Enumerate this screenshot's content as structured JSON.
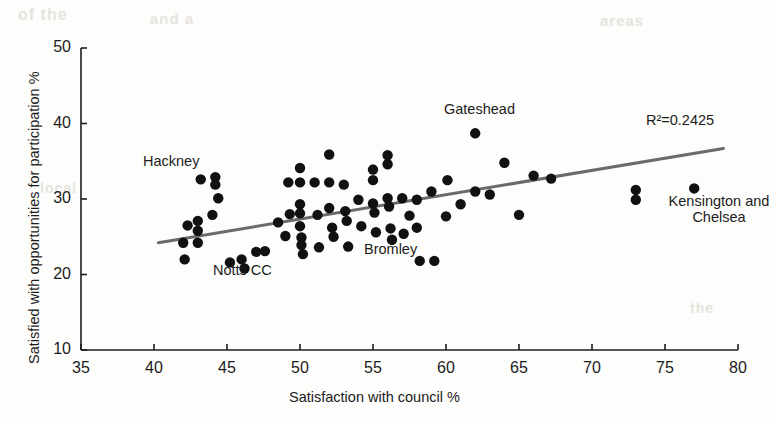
{
  "chart_data": {
    "type": "scatter",
    "title": "",
    "xlabel": "Satisfaction with council %",
    "ylabel": "Satisfied with opportunities for participation %",
    "xlim": [
      35,
      80
    ],
    "ylim": [
      10,
      50
    ],
    "xticks": [
      35,
      40,
      45,
      50,
      55,
      60,
      65,
      70,
      75,
      80
    ],
    "yticks": [
      10,
      20,
      30,
      40,
      50
    ],
    "grid": false,
    "legend": null,
    "r_squared_label": "R²=0.2425",
    "r_squared": 0.2425,
    "trendline": {
      "x_start": 40.3,
      "y_start": 24.2,
      "x_end": 79.0,
      "y_end": 36.7,
      "color": "#6a6a6a",
      "width": 3
    },
    "marker": {
      "color": "#111111",
      "radius": 5.2,
      "shape": "circle"
    },
    "annotations": [
      {
        "name": "Hackney",
        "text": "Hackney",
        "x": 44.2,
        "y": 32.6,
        "align": "right"
      },
      {
        "name": "Notts CC",
        "text": "Notts CC",
        "x": 46.2,
        "y": 18.2,
        "align": "center"
      },
      {
        "name": "Gateshead",
        "text": "Gateshead",
        "x": 62.0,
        "y": 41.0,
        "align": "center"
      },
      {
        "name": "Bromley",
        "text": "Bromley",
        "x": 57.3,
        "y": 21.8,
        "align": "right"
      },
      {
        "name": "Kensington and Chelsea",
        "text": "Kensington and Chelsea",
        "x": 77.2,
        "y": 29.6,
        "align": "center"
      }
    ],
    "points": [
      {
        "x": 42.0,
        "y": 24.2
      },
      {
        "x": 42.1,
        "y": 22.0
      },
      {
        "x": 42.3,
        "y": 26.5
      },
      {
        "x": 43.0,
        "y": 27.1
      },
      {
        "x": 43.0,
        "y": 25.8
      },
      {
        "x": 43.0,
        "y": 24.2
      },
      {
        "x": 43.2,
        "y": 32.6
      },
      {
        "x": 44.0,
        "y": 27.9
      },
      {
        "x": 44.2,
        "y": 32.9
      },
      {
        "x": 44.2,
        "y": 31.9
      },
      {
        "x": 44.4,
        "y": 30.1
      },
      {
        "x": 45.2,
        "y": 21.6
      },
      {
        "x": 46.0,
        "y": 22.0
      },
      {
        "x": 46.2,
        "y": 20.8
      },
      {
        "x": 47.0,
        "y": 23.0
      },
      {
        "x": 47.6,
        "y": 23.1
      },
      {
        "x": 48.5,
        "y": 26.9
      },
      {
        "x": 49.0,
        "y": 25.1
      },
      {
        "x": 49.2,
        "y": 32.2
      },
      {
        "x": 49.3,
        "y": 28.0
      },
      {
        "x": 50.0,
        "y": 34.1
      },
      {
        "x": 50.0,
        "y": 32.2
      },
      {
        "x": 50.0,
        "y": 29.3
      },
      {
        "x": 50.0,
        "y": 28.1
      },
      {
        "x": 50.0,
        "y": 26.4
      },
      {
        "x": 50.1,
        "y": 24.9
      },
      {
        "x": 50.1,
        "y": 23.9
      },
      {
        "x": 50.2,
        "y": 22.7
      },
      {
        "x": 51.0,
        "y": 32.2
      },
      {
        "x": 51.2,
        "y": 27.9
      },
      {
        "x": 51.3,
        "y": 23.6
      },
      {
        "x": 52.0,
        "y": 35.9
      },
      {
        "x": 52.0,
        "y": 32.2
      },
      {
        "x": 52.0,
        "y": 28.8
      },
      {
        "x": 52.2,
        "y": 26.2
      },
      {
        "x": 52.3,
        "y": 25.0
      },
      {
        "x": 53.0,
        "y": 31.9
      },
      {
        "x": 53.1,
        "y": 28.4
      },
      {
        "x": 53.2,
        "y": 27.1
      },
      {
        "x": 53.3,
        "y": 23.7
      },
      {
        "x": 54.0,
        "y": 29.9
      },
      {
        "x": 54.2,
        "y": 26.4
      },
      {
        "x": 55.0,
        "y": 33.9
      },
      {
        "x": 55.0,
        "y": 32.5
      },
      {
        "x": 55.0,
        "y": 29.4
      },
      {
        "x": 55.1,
        "y": 28.2
      },
      {
        "x": 55.2,
        "y": 25.6
      },
      {
        "x": 56.0,
        "y": 35.8
      },
      {
        "x": 56.0,
        "y": 34.6
      },
      {
        "x": 56.0,
        "y": 30.1
      },
      {
        "x": 56.1,
        "y": 29.0
      },
      {
        "x": 56.2,
        "y": 26.1
      },
      {
        "x": 56.3,
        "y": 24.6
      },
      {
        "x": 57.0,
        "y": 30.1
      },
      {
        "x": 57.1,
        "y": 25.4
      },
      {
        "x": 57.5,
        "y": 27.8
      },
      {
        "x": 58.0,
        "y": 29.9
      },
      {
        "x": 58.0,
        "y": 26.2
      },
      {
        "x": 58.2,
        "y": 21.8
      },
      {
        "x": 59.0,
        "y": 31.0
      },
      {
        "x": 59.2,
        "y": 21.8
      },
      {
        "x": 60.0,
        "y": 27.7
      },
      {
        "x": 60.1,
        "y": 32.5
      },
      {
        "x": 61.0,
        "y": 29.3
      },
      {
        "x": 62.0,
        "y": 38.7
      },
      {
        "x": 62.0,
        "y": 31.0
      },
      {
        "x": 63.0,
        "y": 30.6
      },
      {
        "x": 64.0,
        "y": 34.8
      },
      {
        "x": 65.0,
        "y": 27.9
      },
      {
        "x": 66.0,
        "y": 33.1
      },
      {
        "x": 67.2,
        "y": 32.7
      },
      {
        "x": 73.0,
        "y": 31.2
      },
      {
        "x": 73.0,
        "y": 29.9
      },
      {
        "x": 77.0,
        "y": 31.4
      }
    ]
  },
  "artifacts": [
    {
      "text": "of the",
      "x": 18,
      "y": 6,
      "size": 16
    },
    {
      "text": "and a",
      "x": 150,
      "y": 10,
      "size": 15
    },
    {
      "text": "areas",
      "x": 600,
      "y": 12,
      "size": 15
    },
    {
      "text": "local",
      "x": 40,
      "y": 180,
      "size": 14
    },
    {
      "text": "the",
      "x": 690,
      "y": 300,
      "size": 14
    }
  ]
}
